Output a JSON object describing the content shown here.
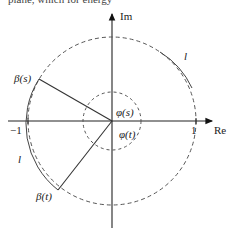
{
  "clipped_header_text": "plane, which for energy",
  "axes": {
    "x_label": "Re",
    "y_label": "Im",
    "tick_neg_one": "−1",
    "tick_one": "1"
  },
  "labels": {
    "beta_s": "β(s)",
    "beta_t": "β(t)",
    "phi_s": "φ(s)",
    "phi_t": "φ(t)",
    "arc_l_upper": "l",
    "arc_l_left": "l"
  },
  "geometry": {
    "origin": [
      112,
      121
    ],
    "unit_circle_radius": 84,
    "inner_circle_radius": 29,
    "beta_s_point": [
      39,
      79
    ],
    "beta_t_point": [
      58,
      190
    ]
  },
  "colors": {
    "stroke": "#333333",
    "dashed": "#555555"
  }
}
